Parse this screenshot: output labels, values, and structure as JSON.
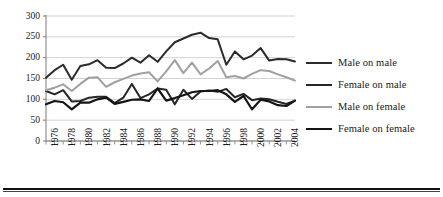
{
  "chart_data": {
    "type": "line",
    "title": "",
    "xlabel": "",
    "ylabel": "",
    "ylim": [
      0,
      300
    ],
    "y_ticks": [
      0,
      50,
      100,
      150,
      200,
      250,
      300
    ],
    "grid": true,
    "legend_position": "right",
    "x": [
      1976,
      1977,
      1978,
      1979,
      1980,
      1981,
      1982,
      1983,
      1984,
      1985,
      1986,
      1987,
      1988,
      1989,
      1990,
      1991,
      1992,
      1993,
      1994,
      1995,
      1996,
      1997,
      1998,
      1999,
      2000,
      2001,
      2002,
      2003,
      2004,
      2005
    ],
    "x_tick_labels": [
      "1976",
      "1978",
      "1980",
      "1982",
      "1984",
      "1986",
      "1988",
      "1990",
      "1992",
      "1994",
      "1996",
      "1998",
      "2000",
      "2002",
      "2004"
    ],
    "series": [
      {
        "name": "Male on male",
        "color": "#2b2b2b",
        "width": 2.0,
        "values": [
          152,
          170,
          183,
          147,
          180,
          184,
          194,
          176,
          175,
          186,
          200,
          188,
          206,
          190,
          215,
          237,
          246,
          255,
          260,
          247,
          244,
          183,
          215,
          196,
          205,
          223,
          193,
          197,
          196,
          191
        ]
      },
      {
        "name": "Female on male",
        "color": "#262626",
        "width": 2.0,
        "values": [
          120,
          112,
          122,
          95,
          96,
          104,
          106,
          106,
          91,
          104,
          137,
          103,
          112,
          126,
          123,
          88,
          123,
          101,
          119,
          121,
          118,
          125,
          105,
          113,
          98,
          102,
          100,
          94,
          89,
          97
        ]
      },
      {
        "name": "Male on female",
        "color": "#a0a0a0",
        "width": 2.0,
        "values": [
          122,
          128,
          136,
          120,
          137,
          152,
          153,
          130,
          141,
          149,
          157,
          162,
          165,
          143,
          167,
          194,
          163,
          188,
          160,
          174,
          192,
          153,
          156,
          150,
          161,
          170,
          168,
          160,
          153,
          145
        ]
      },
      {
        "name": "Female on female",
        "color": "#141414",
        "width": 2.2,
        "values": [
          88,
          96,
          93,
          76,
          92,
          92,
          100,
          104,
          89,
          94,
          99,
          100,
          96,
          126,
          97,
          103,
          110,
          117,
          120,
          120,
          122,
          112,
          94,
          108,
          76,
          99,
          95,
          86,
          84,
          97
        ]
      }
    ]
  },
  "legend": {
    "items": [
      {
        "label": "Male on male"
      },
      {
        "label": "Female on male"
      },
      {
        "label": "Male on female"
      },
      {
        "label": "Female on female"
      }
    ]
  }
}
